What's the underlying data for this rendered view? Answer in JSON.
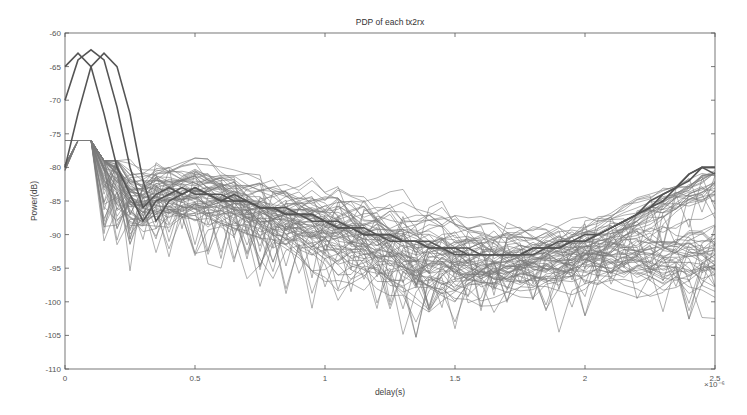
{
  "chart_data": {
    "type": "line",
    "title": "PDP of each tx2rx",
    "xlabel": "delay(s)",
    "ylabel": "Power(dB)",
    "x_multiplier_label": "×10⁻⁶",
    "xlim": [
      0,
      2.5e-06
    ],
    "ylim": [
      -110,
      -60
    ],
    "xticks": [
      0,
      0.5,
      1,
      1.5,
      2,
      2.5
    ],
    "xtick_labels": [
      "0",
      "0.5",
      "1",
      "1.5",
      "2",
      "2.5"
    ],
    "yticks": [
      -110,
      -105,
      -100,
      -95,
      -90,
      -85,
      -80,
      -75,
      -70,
      -65,
      -60
    ],
    "ytick_labels": [
      "-110",
      "-105",
      "-100",
      "-95",
      "-90",
      "-85",
      "-80",
      "-75",
      "-70",
      "-65",
      "-60"
    ],
    "grid": false,
    "legend": null,
    "line_color": "#6e6e6e",
    "x_samples_us": [
      0,
      0.05,
      0.1,
      0.15,
      0.2,
      0.25,
      0.3,
      0.35,
      0.4,
      0.45,
      0.5,
      0.55,
      0.6,
      0.65,
      0.7,
      0.75,
      0.8,
      0.85,
      0.9,
      0.95,
      1.0,
      1.05,
      1.1,
      1.15,
      1.2,
      1.25,
      1.3,
      1.35,
      1.4,
      1.45,
      1.5,
      1.55,
      1.6,
      1.65,
      1.7,
      1.75,
      1.8,
      1.85,
      1.9,
      1.95,
      2.0,
      2.05,
      2.1,
      2.15,
      2.2,
      2.25,
      2.3,
      2.35,
      2.4,
      2.45,
      2.5
    ],
    "series": [
      {
        "name": "direct-path-1",
        "values": [
          -65,
          -63,
          -65,
          -72,
          -80,
          -84,
          -88,
          -85,
          -84,
          -83,
          -84,
          -84,
          -85,
          -84,
          -85,
          -86,
          -86,
          -87,
          -87,
          -88,
          -88,
          -89,
          -89,
          -90,
          -90,
          -91,
          -91,
          -91,
          -92,
          -92,
          -92,
          -93,
          -93,
          -93,
          -93,
          -93,
          -93,
          -92,
          -92,
          -91,
          -91,
          -90,
          -89,
          -88,
          -87,
          -86,
          -85,
          -83,
          -82,
          -80,
          -80
        ]
      },
      {
        "name": "direct-path-2",
        "values": [
          -70,
          -64,
          -62.5,
          -64,
          -71,
          -80,
          -86,
          -84,
          -83,
          -84,
          -83,
          -84,
          -84,
          -85,
          -85,
          -86,
          -86,
          -86,
          -87,
          -87,
          -88,
          -88,
          -89,
          -89,
          -90,
          -90,
          -91,
          -91,
          -91,
          -92,
          -92,
          -92,
          -93,
          -93,
          -93,
          -93,
          -92,
          -92,
          -92,
          -91,
          -91,
          -90,
          -89,
          -88,
          -87,
          -86,
          -84,
          -83,
          -81,
          -80,
          -80
        ]
      },
      {
        "name": "direct-path-3",
        "values": [
          -80,
          -72,
          -65,
          -63,
          -65,
          -72,
          -82,
          -88,
          -85,
          -84,
          -83,
          -84,
          -85,
          -85,
          -85,
          -86,
          -86,
          -87,
          -87,
          -87,
          -88,
          -89,
          -89,
          -90,
          -90,
          -90,
          -91,
          -91,
          -92,
          -92,
          -93,
          -93,
          -93,
          -93,
          -93,
          -93,
          -92,
          -92,
          -91,
          -91,
          -90,
          -90,
          -89,
          -88,
          -87,
          -85,
          -84,
          -83,
          -81,
          -80,
          -81
        ]
      }
    ],
    "ensemble": {
      "description": "approx. 70 additional gray PDP curves forming a noisy band",
      "count": 70,
      "mean_db": [
        -80,
        -79,
        -78.5,
        -79,
        -81,
        -84,
        -85,
        -84,
        -84,
        -84,
        -84,
        -84.5,
        -85,
        -85.5,
        -86,
        -86.5,
        -87,
        -87.5,
        -88,
        -88.5,
        -89,
        -89.5,
        -90,
        -90.5,
        -91,
        -91.5,
        -92,
        -92.5,
        -93,
        -93,
        -93.5,
        -93.5,
        -94,
        -94,
        -94,
        -94,
        -94,
        -93.5,
        -93.5,
        -93.5,
        -93.5,
        -93.5,
        -93.5,
        -93.5,
        -93.5,
        -93.5,
        -93.5,
        -93,
        -93,
        -93,
        -93
      ],
      "spread_db": [
        3,
        3,
        3,
        3,
        3,
        3,
        3,
        3,
        3,
        3,
        3,
        3,
        3,
        3,
        3,
        3,
        3,
        3,
        3,
        3.5,
        3.5,
        4,
        4,
        4,
        4,
        4,
        4,
        4,
        4,
        4,
        4,
        3.5,
        3.5,
        3.5,
        3,
        3,
        3,
        3,
        3,
        3,
        3,
        3,
        3,
        3,
        3,
        3,
        3,
        3,
        3.5,
        3.5,
        3.5
      ],
      "min_db_observed": -105.5,
      "max_db_observed": -77
    }
  }
}
